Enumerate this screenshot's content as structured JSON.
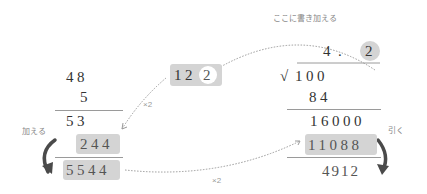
{
  "annotation_top": "ここに書き加える",
  "left_calc": {
    "row1": "48",
    "row2": "5",
    "row3": "53",
    "row4": "244",
    "row5": "5544",
    "add_label": "加える"
  },
  "middle": {
    "box_prefix": "12",
    "box_circled": "2",
    "times2_upper": "×2",
    "times2_lower": "×2"
  },
  "right_calc": {
    "quotient_int": "4",
    "quotient_dot": ".",
    "quotient_digit": "2",
    "sqrt_symbol": "√",
    "radicand": "100",
    "row_84": "84",
    "row_16000": "16000",
    "row_11088": "11088",
    "row_4912": "4912",
    "subtract_label": "引く"
  },
  "colors": {
    "highlight": "#d4d4d4",
    "arrow": "#4a4a4a",
    "dotted": "#999999",
    "text": "#333333"
  }
}
